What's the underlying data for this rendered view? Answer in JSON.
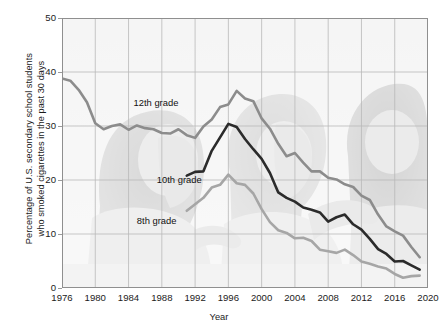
{
  "chart_data": {
    "type": "line",
    "title": "",
    "xlabel": "Year",
    "ylabel": "Percentage of U.S. secondary school students\nwho smoked cigarettes in the past 30 days",
    "xlim": [
      1976,
      2020
    ],
    "ylim": [
      0,
      50
    ],
    "xticks": [
      "1976",
      "1980",
      "1984",
      "1988",
      "1992",
      "1996",
      "2000",
      "2004",
      "2008",
      "2012",
      "2016",
      "2020"
    ],
    "yticks": [
      "0",
      "10",
      "20",
      "30",
      "40",
      "50"
    ],
    "grid": true,
    "legend_position": "inline-annotations",
    "series": [
      {
        "name": "12th grade",
        "color": "#8c8c8c",
        "label_x": 1984.6,
        "label_y": 34.2,
        "x": [
          1976,
          1977,
          1978,
          1979,
          1980,
          1981,
          1982,
          1983,
          1984,
          1985,
          1986,
          1987,
          1988,
          1989,
          1990,
          1991,
          1992,
          1993,
          1994,
          1995,
          1996,
          1997,
          1998,
          1999,
          2000,
          2001,
          2002,
          2003,
          2004,
          2005,
          2006,
          2007,
          2008,
          2009,
          2010,
          2011,
          2012,
          2013,
          2014,
          2015,
          2016,
          2017,
          2018,
          2019
        ],
        "values": [
          38.8,
          38.4,
          36.7,
          34.4,
          30.5,
          29.4,
          30.0,
          30.3,
          29.3,
          30.1,
          29.6,
          29.4,
          28.7,
          28.6,
          29.4,
          28.3,
          27.8,
          29.9,
          31.2,
          33.5,
          34.0,
          36.5,
          35.1,
          34.6,
          31.4,
          29.5,
          26.7,
          24.4,
          25.0,
          23.2,
          21.6,
          21.6,
          20.4,
          20.1,
          19.2,
          18.7,
          17.1,
          16.3,
          13.6,
          11.4,
          10.5,
          9.7,
          7.6,
          5.7
        ]
      },
      {
        "name": "10th grade",
        "color": "#2b2b2b",
        "label_x": 1987.4,
        "label_y": 20.0,
        "x": [
          1991,
          1992,
          1993,
          1994,
          1995,
          1996,
          1997,
          1998,
          1999,
          2000,
          2001,
          2002,
          2003,
          2004,
          2005,
          2006,
          2007,
          2008,
          2009,
          2010,
          2011,
          2012,
          2013,
          2014,
          2015,
          2016,
          2017,
          2018,
          2019
        ],
        "values": [
          20.8,
          21.5,
          21.6,
          25.4,
          27.9,
          30.4,
          29.8,
          27.6,
          25.7,
          23.9,
          21.3,
          17.7,
          16.7,
          16.0,
          14.9,
          14.5,
          14.0,
          12.3,
          13.1,
          13.6,
          11.8,
          10.8,
          9.1,
          7.2,
          6.3,
          4.9,
          5.0,
          4.2,
          3.4
        ]
      },
      {
        "name": "8th grade",
        "color": "#a6a6a6",
        "label_x": 1985.0,
        "label_y": 12.4,
        "x": [
          1991,
          1992,
          1993,
          1994,
          1995,
          1996,
          1997,
          1998,
          1999,
          2000,
          2001,
          2002,
          2003,
          2004,
          2005,
          2006,
          2007,
          2008,
          2009,
          2010,
          2011,
          2012,
          2013,
          2014,
          2015,
          2016,
          2017,
          2018,
          2019
        ],
        "values": [
          14.3,
          15.5,
          16.7,
          18.6,
          19.1,
          21.0,
          19.4,
          19.1,
          17.5,
          14.6,
          12.2,
          10.7,
          10.2,
          9.2,
          9.3,
          8.7,
          7.1,
          6.8,
          6.5,
          7.1,
          6.1,
          4.9,
          4.5,
          4.0,
          3.6,
          2.6,
          1.9,
          2.2,
          2.3
        ]
      }
    ]
  },
  "background_photo": {
    "description": "faded grayscale photograph of three school children"
  }
}
